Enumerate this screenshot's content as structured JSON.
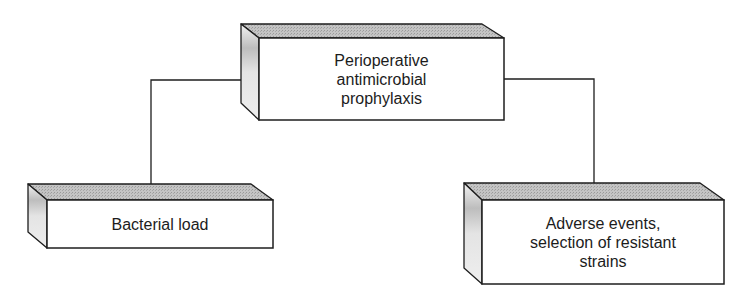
{
  "diagram": {
    "colors": {
      "line": "#1e1e1e",
      "top_face": "#b8b8b8",
      "side_face": "#e6e6e6",
      "front_face": "#ffffff",
      "text": "#1c1c1c"
    },
    "nodes": [
      {
        "id": "root",
        "label": "Perioperative\nantimicrobial\nprophylaxis",
        "back": {
          "x1": 241,
          "y": 24,
          "x2": 482
        },
        "front": {
          "x1": 259,
          "y1": 38,
          "x2": 504,
          "y2": 120
        },
        "side_bottom_y": 103
      },
      {
        "id": "left",
        "label": "Bacterial load",
        "back": {
          "x1": 28,
          "y": 184,
          "x2": 251
        },
        "front": {
          "x1": 47,
          "y1": 200,
          "x2": 273,
          "y2": 248
        },
        "side_bottom_y": 232
      },
      {
        "id": "right",
        "label": "Adverse events,\nselection of resistant\nstrains",
        "back": {
          "x1": 464,
          "y": 183,
          "x2": 700
        },
        "front": {
          "x1": 482,
          "y1": 200,
          "x2": 724,
          "y2": 284
        },
        "side_bottom_y": 268
      }
    ],
    "edges": [
      {
        "from": "root",
        "to": "left",
        "points": [
          [
            241,
            80
          ],
          [
            151,
            80
          ],
          [
            151,
            184
          ]
        ]
      },
      {
        "from": "root",
        "to": "right",
        "points": [
          [
            504,
            79
          ],
          [
            594,
            79
          ],
          [
            594,
            183
          ]
        ]
      }
    ]
  }
}
